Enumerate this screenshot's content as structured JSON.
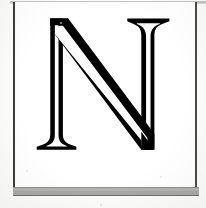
{
  "image": {
    "kind": "scanned-page-initial",
    "subject": "decorative inline capital letter",
    "letter": "N",
    "caption": "",
    "alt_text": "Large decorative inline capital letter N",
    "background_color": "#fcfcfb",
    "paper_color": "#ffffff",
    "ink_color": "#000000",
    "frame_color": "#3c3c3c",
    "band_color": "#a7a7a5"
  },
  "frame": {
    "name": "ink-border",
    "left_rule_visible": "true",
    "right_rule_visible": "true",
    "bottom_rule_visible": "true",
    "top_rule_color": "#b9b9b9"
  },
  "glyph": {
    "character": "N",
    "style": "inline / outlined serif display capital",
    "stroke_color": "#000000",
    "inline_color": "#ffffff",
    "features": {
      "left_stem": "vertical, serifed top-left apex and bracketed bottom serif",
      "diagonal": "thick descending stroke from top-left to bottom-right",
      "right_stem": "vertical with heavy bracketed top serif, pointed bottom vertex"
    },
    "bounds": {
      "x": 48,
      "y": 30,
      "width": 124,
      "height": 136
    }
  },
  "bottom_band": {
    "name": "page-edge-band",
    "label": "",
    "color": "#a7a7a5",
    "top": 187,
    "height": 9
  }
}
